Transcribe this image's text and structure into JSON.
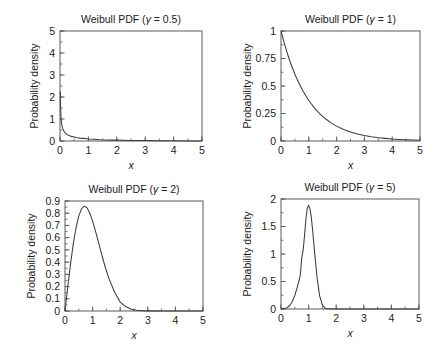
{
  "figure": {
    "background": "#ffffff",
    "curve_color": "#3c3c3c",
    "axis_color": "#5a5a5a",
    "panel_count": 4
  },
  "chart_data": [
    {
      "type": "line",
      "title": "Weibull PDF (γ = 0.5)",
      "title_prefix": "Weibull PDF (",
      "title_symbol": "γ",
      "title_suffix": " = 0.5)",
      "shape_gamma": 0.5,
      "xlabel": "x",
      "ylabel": "Probability density",
      "xlim": [
        0,
        5
      ],
      "ylim": [
        0,
        5
      ],
      "xticks": [
        0,
        1,
        2,
        3,
        4,
        5
      ],
      "xticklabels": [
        "0",
        "1",
        "2",
        "3",
        "4",
        "5"
      ],
      "yticks": [
        0,
        1,
        2,
        3,
        4,
        5
      ],
      "yticklabels": [
        "0",
        "1",
        "2",
        "3",
        "4",
        "5"
      ],
      "minor_x_step": 0.5,
      "minor_y_step": 0.5,
      "grid": false,
      "legend": false,
      "x": [
        0.01,
        0.02,
        0.04,
        0.06,
        0.08,
        0.1,
        0.15,
        0.2,
        0.25,
        0.3,
        0.4,
        0.5,
        0.6,
        0.7,
        0.8,
        0.9,
        1.0,
        1.2,
        1.4,
        1.6,
        1.8,
        2.0,
        2.25,
        2.5,
        2.75,
        3.0,
        3.5,
        4.0,
        4.5,
        5.0
      ],
      "y": [
        2.26,
        1.53,
        1.0,
        0.77,
        0.64,
        0.56,
        0.42,
        0.35,
        0.29,
        0.26,
        0.21,
        0.18,
        0.15,
        0.13,
        0.12,
        0.11,
        0.09,
        0.08,
        0.06,
        0.05,
        0.04,
        0.04,
        0.03,
        0.02,
        0.02,
        0.02,
        0.01,
        0.01,
        0.0,
        0.0
      ]
    },
    {
      "type": "line",
      "title": "Weibull PDF (γ = 1)",
      "title_prefix": "Weibull PDF (",
      "title_symbol": "γ",
      "title_suffix": " = 1)",
      "shape_gamma": 1,
      "xlabel": "x",
      "ylabel": "Probability density",
      "xlim": [
        0,
        5
      ],
      "ylim": [
        0,
        1
      ],
      "xticks": [
        0,
        1,
        2,
        3,
        4,
        5
      ],
      "xticklabels": [
        "0",
        "1",
        "2",
        "3",
        "4",
        "5"
      ],
      "yticks": [
        0,
        0.25,
        0.5,
        0.75,
        1
      ],
      "yticklabels": [
        "0",
        "0.25",
        "0.5",
        "0.75",
        "1"
      ],
      "minor_x_step": 0.5,
      "minor_y_step": 0.125,
      "grid": false,
      "legend": false,
      "x": [
        0,
        0.1,
        0.2,
        0.3,
        0.4,
        0.5,
        0.6,
        0.8,
        1.0,
        1.2,
        1.4,
        1.6,
        1.8,
        2.0,
        2.25,
        2.5,
        2.75,
        3.0,
        3.25,
        3.5,
        3.75,
        4.0,
        4.25,
        4.5,
        5.0
      ],
      "y": [
        1.0,
        0.905,
        0.819,
        0.741,
        0.67,
        0.607,
        0.549,
        0.449,
        0.368,
        0.301,
        0.247,
        0.202,
        0.165,
        0.135,
        0.105,
        0.082,
        0.064,
        0.05,
        0.039,
        0.03,
        0.024,
        0.018,
        0.014,
        0.011,
        0.007
      ]
    },
    {
      "type": "line",
      "title": "Weibull PDF (γ = 2)",
      "title_prefix": "Weibull PDF (",
      "title_symbol": "γ",
      "title_suffix": " = 2)",
      "shape_gamma": 2,
      "xlabel": "x",
      "ylabel": "Probability density",
      "xlim": [
        0,
        5
      ],
      "ylim": [
        0,
        0.9
      ],
      "xticks": [
        0,
        1,
        2,
        3,
        4,
        5
      ],
      "xticklabels": [
        "0",
        "1",
        "2",
        "3",
        "4",
        "5"
      ],
      "yticks": [
        0,
        0.1,
        0.2,
        0.3,
        0.4,
        0.5,
        0.6,
        0.7,
        0.8,
        0.9
      ],
      "yticklabels": [
        "0",
        "0.1",
        "0.2",
        "0.3",
        "0.4",
        "0.5",
        "0.6",
        "0.7",
        "0.8",
        "0.9"
      ],
      "minor_x_step": 0.5,
      "minor_y_step": 0.05,
      "grid": false,
      "legend": false,
      "peak_x": 0.707,
      "peak_y": 0.858,
      "x": [
        0,
        0.1,
        0.2,
        0.3,
        0.4,
        0.5,
        0.6,
        0.7,
        0.8,
        0.9,
        1.0,
        1.1,
        1.2,
        1.3,
        1.4,
        1.5,
        1.6,
        1.8,
        2.0,
        2.2,
        2.4,
        2.6,
        2.8,
        3.0,
        3.5,
        4.0,
        5.0
      ],
      "y": [
        0,
        0.198,
        0.384,
        0.549,
        0.681,
        0.779,
        0.837,
        0.858,
        0.844,
        0.8,
        0.736,
        0.658,
        0.573,
        0.488,
        0.405,
        0.329,
        0.261,
        0.154,
        0.073,
        0.036,
        0.015,
        0.006,
        0.002,
        0.001,
        0.0,
        0.0,
        0.0
      ]
    },
    {
      "type": "line",
      "title": "Weibull PDF (γ = 5)",
      "title_prefix": "Weibull PDF (",
      "title_symbol": "γ",
      "title_suffix": " = 5)",
      "shape_gamma": 5,
      "xlabel": "x",
      "ylabel": "Probability density",
      "xlim": [
        0,
        5
      ],
      "ylim": [
        0,
        2
      ],
      "xticks": [
        0,
        1,
        2,
        3,
        4,
        5
      ],
      "xticklabels": [
        "0",
        "1",
        "2",
        "3",
        "4",
        "5"
      ],
      "yticks": [
        0,
        0.5,
        1,
        1.5,
        2
      ],
      "yticklabels": [
        "0",
        "0.5",
        "1",
        "1.5",
        "2"
      ],
      "minor_x_step": 0.5,
      "minor_y_step": 0.25,
      "grid": false,
      "legend": false,
      "peak_x": 0.92,
      "peak_y": 1.88,
      "x": [
        0,
        0.2,
        0.3,
        0.4,
        0.5,
        0.6,
        0.65,
        0.7,
        0.75,
        0.8,
        0.85,
        0.9,
        0.95,
        1.0,
        1.05,
        1.1,
        1.15,
        1.2,
        1.3,
        1.4,
        1.5,
        1.6,
        1.8,
        2.0,
        2.5,
        3.0,
        4.0,
        5.0
      ],
      "y": [
        0,
        0.016,
        0.054,
        0.127,
        0.246,
        0.414,
        0.513,
        0.618,
        0.924,
        1.06,
        1.32,
        1.62,
        1.83,
        1.88,
        1.82,
        1.66,
        1.41,
        1.13,
        0.6,
        0.24,
        0.07,
        0.015,
        0.0,
        0.0,
        0.0,
        0.0,
        0.0,
        0.0
      ]
    }
  ]
}
